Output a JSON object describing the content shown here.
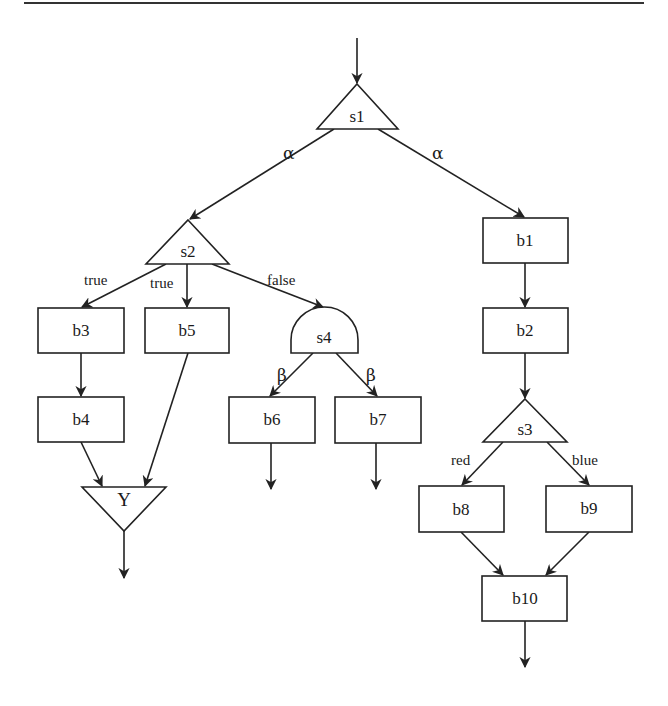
{
  "diagram": {
    "type": "control-flow-graph",
    "nodes": {
      "s1": {
        "label": "s1",
        "shape": "triangle"
      },
      "s2": {
        "label": "s2",
        "shape": "triangle"
      },
      "s3": {
        "label": "s3",
        "shape": "triangle"
      },
      "s4": {
        "label": "s4",
        "shape": "semicircle"
      },
      "b1": {
        "label": "b1",
        "shape": "box"
      },
      "b2": {
        "label": "b2",
        "shape": "box"
      },
      "b3": {
        "label": "b3",
        "shape": "box"
      },
      "b4": {
        "label": "b4",
        "shape": "box"
      },
      "b5": {
        "label": "b5",
        "shape": "box"
      },
      "b6": {
        "label": "b6",
        "shape": "box"
      },
      "b7": {
        "label": "b7",
        "shape": "box"
      },
      "b8": {
        "label": "b8",
        "shape": "box"
      },
      "b9": {
        "label": "b9",
        "shape": "box"
      },
      "b10": {
        "label": "b10",
        "shape": "box"
      },
      "Y": {
        "label": "Y",
        "shape": "inverted-triangle"
      }
    },
    "edge_labels": {
      "s1_s2": "α",
      "s1_b1": "α",
      "s2_b3": "true",
      "s2_b5": "true",
      "s2_s4": "false",
      "s4_b6": "β",
      "s4_b7": "β",
      "s3_b8": "red",
      "s3_b9": "blue"
    },
    "edges": [
      [
        "entry",
        "s1"
      ],
      [
        "s1",
        "s2"
      ],
      [
        "s1",
        "b1"
      ],
      [
        "s2",
        "b3"
      ],
      [
        "s2",
        "b5"
      ],
      [
        "s2",
        "s4"
      ],
      [
        "b3",
        "b4"
      ],
      [
        "b4",
        "Y"
      ],
      [
        "b5",
        "Y"
      ],
      [
        "Y",
        "exit"
      ],
      [
        "s4",
        "b6"
      ],
      [
        "s4",
        "b7"
      ],
      [
        "b6",
        "exit"
      ],
      [
        "b7",
        "exit"
      ],
      [
        "b1",
        "b2"
      ],
      [
        "b2",
        "s3"
      ],
      [
        "s3",
        "b8"
      ],
      [
        "s3",
        "b9"
      ],
      [
        "b8",
        "b10"
      ],
      [
        "b9",
        "b10"
      ],
      [
        "b10",
        "exit"
      ]
    ]
  }
}
